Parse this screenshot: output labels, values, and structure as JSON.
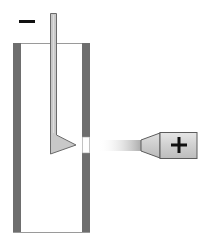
{
  "diagram": {
    "labels": {
      "negative_terminal": "−",
      "positive_terminal": "+"
    },
    "colors": {
      "background": "#ffffff",
      "tube_wall": "#6e6e6e",
      "tube_rim": "#9a9a9a",
      "electrode_fill": "#c8c8c8",
      "electrode_stroke": "#6a6a6a",
      "probe_fill": "#d4d4d4",
      "probe_stroke": "#5c5c5c",
      "beam_start": "#ffffff",
      "beam_end": "#a8a8a8",
      "symbol": "#111111"
    },
    "components": [
      {
        "id": "negative-sign",
        "symbol": "minus"
      },
      {
        "id": "tube",
        "shape": "open-top-vessel"
      },
      {
        "id": "electrode",
        "shape": "rod-with-triangular-tip"
      },
      {
        "id": "wall-opening",
        "shape": "window"
      },
      {
        "id": "beam",
        "shape": "gradient-stream"
      },
      {
        "id": "probe",
        "shape": "nozzle-with-plus"
      }
    ]
  }
}
